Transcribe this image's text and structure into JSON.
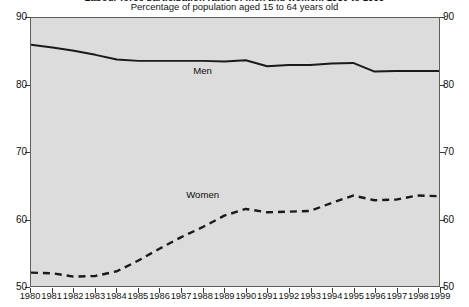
{
  "chart_data": {
    "type": "line",
    "title": "Labour force participation rates of men and women, 1980 to 1999",
    "subtitle": "Percentage of population aged 15 to 64 years old",
    "xlabel": "",
    "ylabel": "",
    "x": [
      1980,
      1981,
      1982,
      1983,
      1984,
      1985,
      1986,
      1987,
      1988,
      1989,
      1990,
      1991,
      1992,
      1993,
      1994,
      1995,
      1996,
      1997,
      1998,
      1999
    ],
    "categories": [
      "1980",
      "1981",
      "1982",
      "1983",
      "1984",
      "1985",
      "1986",
      "1987",
      "1988",
      "1989",
      "1990",
      "1991",
      "1992",
      "1993",
      "1994",
      "1995",
      "1996",
      "1997",
      "1998",
      "1999"
    ],
    "xlim": [
      1980,
      1999
    ],
    "ylim": [
      50,
      90
    ],
    "yticks": [
      50,
      60,
      70,
      80,
      90
    ],
    "ytick_labels_left": [
      "50",
      "60",
      "70",
      "80",
      "90"
    ],
    "ytick_labels_right": [
      "50",
      "60",
      "70",
      "80",
      "90"
    ],
    "grid": false,
    "legend": "inline labels on series",
    "series": [
      {
        "name": "Men",
        "style": "solid",
        "color": "#1a1a1a",
        "label_x": 1988,
        "label_y": 82.0,
        "values": [
          86.0,
          85.6,
          85.1,
          84.5,
          83.8,
          83.6,
          83.6,
          83.6,
          83.6,
          83.5,
          83.7,
          82.8,
          83.0,
          83.0,
          83.2,
          83.3,
          82.0,
          82.1,
          82.1,
          82.1
        ]
      },
      {
        "name": "Women",
        "style": "dashed",
        "color": "#1a1a1a",
        "label_x": 1988,
        "label_y": 63.6,
        "values": [
          52.0,
          51.9,
          51.4,
          51.5,
          52.2,
          53.8,
          55.6,
          57.3,
          58.8,
          60.5,
          61.5,
          61.0,
          61.1,
          61.2,
          62.4,
          63.5,
          62.8,
          62.9,
          63.5,
          63.4
        ]
      }
    ]
  }
}
